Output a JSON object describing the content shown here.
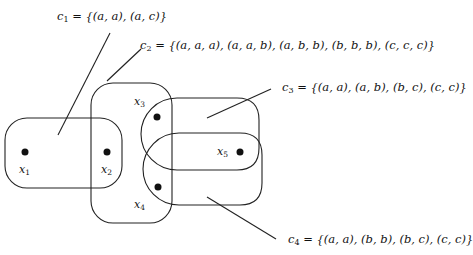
{
  "constraints": [
    {
      "id": "c1",
      "name": "c",
      "sub": "1",
      "relation": "= {(a, a), (a, c)}",
      "tuples": [
        "(a, a)",
        "(a, c)"
      ],
      "scope": [
        "x1",
        "x2"
      ]
    },
    {
      "id": "c2",
      "name": "c",
      "sub": "2",
      "relation": "= {(a, a, a), (a, a, b), (a, b, b), (b, b, b), (c, c, c)}",
      "tuples": [
        "(a, a, a)",
        "(a, a, b)",
        "(a, b, b)",
        "(b, b, b)",
        "(c, c, c)"
      ],
      "scope": [
        "x2",
        "x3",
        "x4"
      ]
    },
    {
      "id": "c3",
      "name": "c",
      "sub": "3",
      "relation": "= {(a, a), (a, b), (b, c), (c, c)}",
      "tuples": [
        "(a, a)",
        "(a, b)",
        "(b, c)",
        "(c, c)"
      ],
      "scope": [
        "x3",
        "x5"
      ]
    },
    {
      "id": "c4",
      "name": "c",
      "sub": "4",
      "relation": "= {(a, a), (b, b), (b, c), (c, c)}",
      "tuples": [
        "(a, a)",
        "(b, b)",
        "(b, c)",
        "(c, c)"
      ],
      "scope": [
        "x4",
        "x5"
      ]
    }
  ],
  "variables": [
    {
      "id": "x1",
      "name": "x",
      "sub": "1"
    },
    {
      "id": "x2",
      "name": "x",
      "sub": "2"
    },
    {
      "id": "x3",
      "name": "x",
      "sub": "3"
    },
    {
      "id": "x4",
      "name": "x",
      "sub": "4"
    },
    {
      "id": "x5",
      "name": "x",
      "sub": "5"
    }
  ],
  "colors": {
    "stroke": "#222222",
    "background": "#ffffff"
  }
}
